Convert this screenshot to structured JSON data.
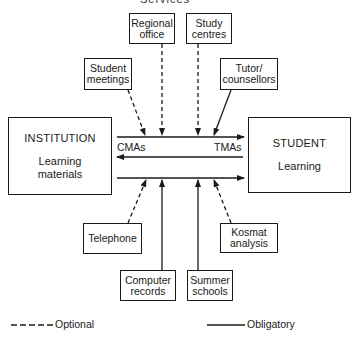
{
  "header": {
    "cropped_title": "Services"
  },
  "central": {
    "institution": {
      "title": "INSTITUTION",
      "subtitle": "Learning materials"
    },
    "student": {
      "title": "STUDENT",
      "subtitle": "Learning"
    },
    "flows": {
      "left_label": "CMAs",
      "right_label": "TMAs"
    }
  },
  "top_services": [
    {
      "label": "Regional office",
      "line": "optional"
    },
    {
      "label": "Study centres",
      "line": "optional"
    },
    {
      "label": "Student meetings",
      "line": "optional"
    },
    {
      "label": "Tutor/ counsellors",
      "line": "obligatory"
    }
  ],
  "bottom_services": [
    {
      "label": "Telephone",
      "line": "optional"
    },
    {
      "label": "Computer records",
      "line": "obligatory"
    },
    {
      "label": "Summer schools",
      "line": "obligatory"
    },
    {
      "label": "Kosmat analysis",
      "line": "optional"
    }
  ],
  "legend": {
    "optional": "Optional",
    "obligatory": "Obligatory"
  },
  "colors": {
    "ink": "#1a1a1a",
    "background": "#ffffff"
  }
}
